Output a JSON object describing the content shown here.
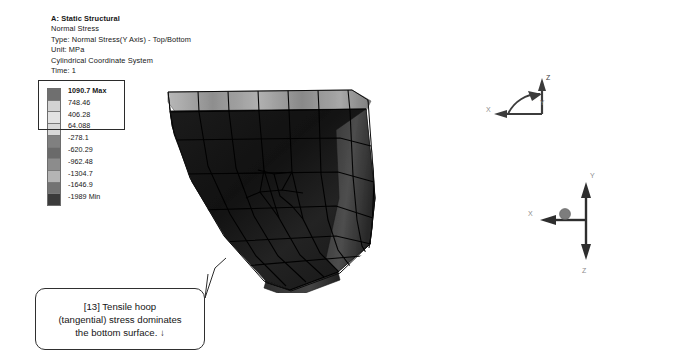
{
  "result_header": {
    "analysis_system": "A: Static Structural",
    "result_name": "Normal Stress",
    "type": "Type: Normal Stress(Y Axis) - Top/Bottom",
    "unit": "Unit: MPa",
    "coordinate_system": "Cylindrical Coordinate System",
    "time": "Time: 1"
  },
  "legend": {
    "title": "Normal Stress legend",
    "entries": [
      {
        "label": "1090.7 Max",
        "color": "#6f6f6f",
        "bold": true
      },
      {
        "label": "748.46",
        "color": "#d2d2d2",
        "bold": false
      },
      {
        "label": "406.28",
        "color": "#e2e2e2",
        "bold": false
      },
      {
        "label": "64.088",
        "color": "#d8d8d8",
        "bold": false
      },
      {
        "label": "-278.1",
        "color": "#808080",
        "bold": false
      },
      {
        "label": "-620.29",
        "color": "#6a6a6a",
        "bold": false
      },
      {
        "label": "-962.48",
        "color": "#8c8c8c",
        "bold": false
      },
      {
        "label": "-1304.7",
        "color": "#b4b4b4",
        "bold": false
      },
      {
        "label": "-1646.9",
        "color": "#737373",
        "bold": false
      },
      {
        "label": "-1989 Min",
        "color": "#3b3b3b",
        "bold": false
      }
    ],
    "highlight_count": 4,
    "max_value": "1090.7",
    "min_value": "-1989"
  },
  "model": {
    "name": "curved-shell-mesh",
    "surface_color": "#161616",
    "top_band_color": "#9a9a9a",
    "edge_color": "#545454",
    "mesh_line_color": "#000000"
  },
  "triads": {
    "upper": {
      "name": "cylindrical-coordinate-triad",
      "labels": [
        "Z",
        "Y",
        "X"
      ]
    },
    "lower": {
      "name": "global-coordinate-triad",
      "labels": [
        "Y",
        "X",
        "Z"
      ]
    }
  },
  "callout": {
    "lines": [
      "[13] Tensile hoop",
      "(tangential) stress dominates",
      "the bottom surface.  ↓"
    ],
    "index": "[13]"
  },
  "colors": {
    "background": "#ffffff",
    "text": "#161616",
    "border": "#2f2f2f"
  }
}
